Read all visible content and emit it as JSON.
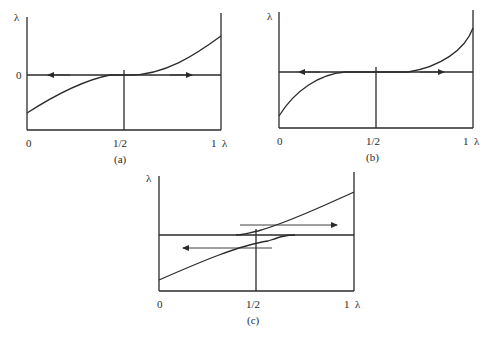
{
  "panels": [
    {
      "id": "a",
      "caption": "(a)",
      "y_axis_label": "λ",
      "x_axis_label": "λ",
      "y_tick_labels": [
        "0"
      ],
      "x_tick_labels": [
        "0",
        "1/2",
        "1"
      ],
      "description": "Curve rising from below zero at λ=0, tangent to zero line near 1/2, rising above at λ=1; arrows pointing left on left half and right on right half"
    },
    {
      "id": "b",
      "caption": "(b)",
      "y_axis_label": "λ",
      "x_axis_label": "λ",
      "x_tick_labels": [
        "0",
        "1/2",
        "1"
      ],
      "description": "Curve rises from below and meets horizontal line before 1/2; flat segment through middle; rises after ~0.67; arrows pointing left and right"
    },
    {
      "id": "c",
      "caption": "(c)",
      "y_axis_label": "λ",
      "x_axis_label": "λ",
      "x_tick_labels": [
        "0",
        "1/2",
        "1"
      ],
      "description": "Two nearly linear rising branches crossing the horizontal line around 1/2; right arrow above, left arrow below"
    }
  ]
}
